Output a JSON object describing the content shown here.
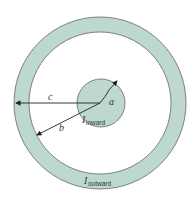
{
  "diagram": {
    "colors": {
      "conductor_fill": "#bcd8cf",
      "stroke": "#555555",
      "background": "#ffffff",
      "arrow": "#222222"
    },
    "geometry": {
      "center": [
        100,
        103
      ],
      "inner_radius": 24,
      "outer_ring_inner_radius": 71,
      "outer_ring_outer_radius": 86
    },
    "labels": {
      "a": "a",
      "b": "b",
      "c": "c",
      "inner_current_symbol": "I",
      "inner_current_subscript": "inward",
      "outer_current_symbol": "I",
      "outer_current_subscript": "outward"
    }
  }
}
